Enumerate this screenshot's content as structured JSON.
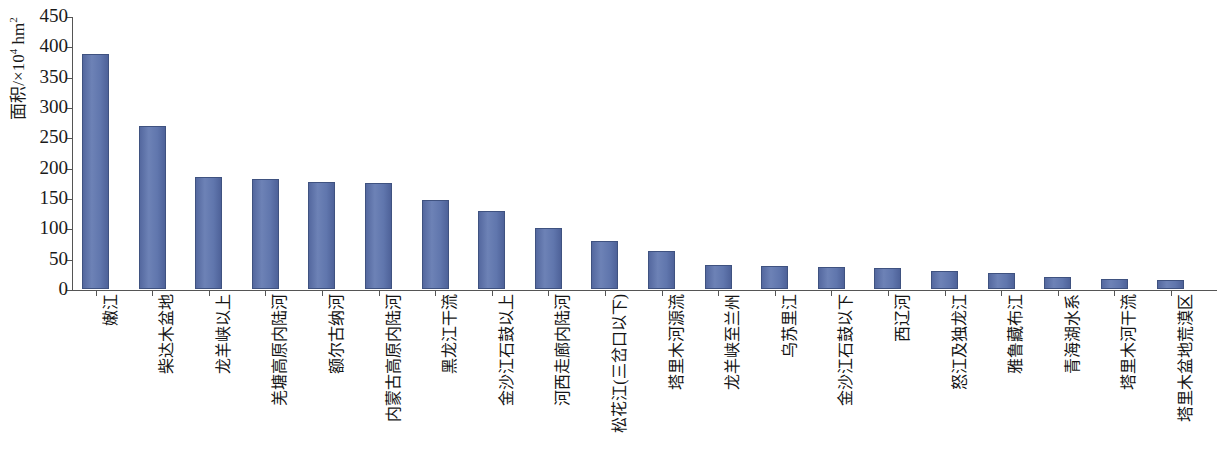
{
  "chart_data": {
    "type": "bar",
    "title": "",
    "xlabel": "",
    "ylabel": "面积/×10⁴ hm²",
    "ylabel_main": "面积/×10",
    "ylabel_exp": "4",
    "ylabel_unit": " hm",
    "ylabel_unit_exp": "2",
    "ylim": [
      0,
      450
    ],
    "ytick_step": 50,
    "yticks": [
      0,
      50,
      100,
      150,
      200,
      250,
      300,
      350,
      400,
      450
    ],
    "grid": false,
    "legend": null,
    "bar_color": "#5c71a8",
    "bar_edge_color": "#3f5280",
    "axis_color": "#555555",
    "background": "#ffffff",
    "categories": [
      "嫩江",
      "柴达木盆地",
      "龙羊峡以上",
      "羌塘高原内陆河",
      "额尔古纳河",
      "内蒙古高原内陆河",
      "黑龙江干流",
      "金沙江石鼓以上",
      "河西走廊内陆河",
      "松花江(三岔口以下)",
      "塔里木河源流",
      "龙羊峡至兰州",
      "乌苏里江",
      "金沙江石鼓以下",
      "西辽河",
      "怒江及独龙江",
      "雅鲁藏布江",
      "青海湖水系",
      "塔里木河干流",
      "塔里木盆地荒漠区"
    ],
    "values": [
      388,
      268,
      184,
      181,
      177,
      175,
      147,
      129,
      100,
      79,
      62,
      40,
      38,
      36,
      34,
      29,
      27,
      19,
      17,
      15
    ]
  }
}
